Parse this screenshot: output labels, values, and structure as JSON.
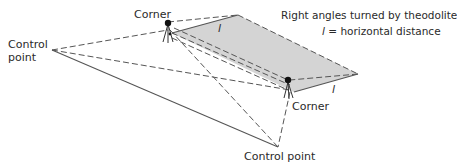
{
  "labels": {
    "corner_top": "Corner",
    "corner_bottom": "Corner",
    "control_left_line1": "Control",
    "control_left_line2": "point",
    "control_bottom": "Control point",
    "legend_line1": "Right angles turned by theodolite",
    "legend_l_symbol": "l",
    "legend_line2": " = horizontal distance",
    "distance_label_top": "l",
    "distance_label_right": "l"
  },
  "colors": {
    "line": "#555555",
    "shade": "#d4d4d4",
    "text": "#2a2a2a",
    "tripod_head": "#111111"
  }
}
